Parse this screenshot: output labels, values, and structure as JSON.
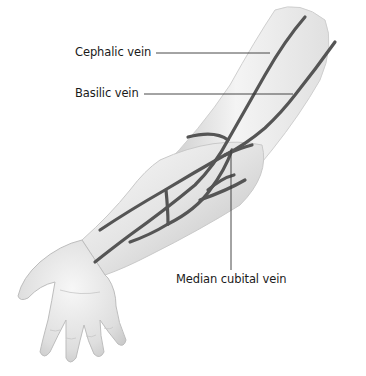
{
  "figure": {
    "labels": [
      {
        "id": "cephalic",
        "text": "Cephalic vein",
        "x": 75,
        "y": 43
      },
      {
        "id": "basilic",
        "text": "Basilic vein",
        "x": 75,
        "y": 88
      },
      {
        "id": "median_cubital",
        "text": "Median cubital vein",
        "x": 176,
        "y": 273
      }
    ],
    "colors": {
      "skin_light": "#f2f2f2",
      "skin_mid": "#d9d9d9",
      "skin_shadow": "#b8b8b8",
      "vein": "#5a5a5a",
      "vein_edge": "#3c3c3c",
      "leader_line": "#333333",
      "text": "#1a1a1a"
    }
  }
}
